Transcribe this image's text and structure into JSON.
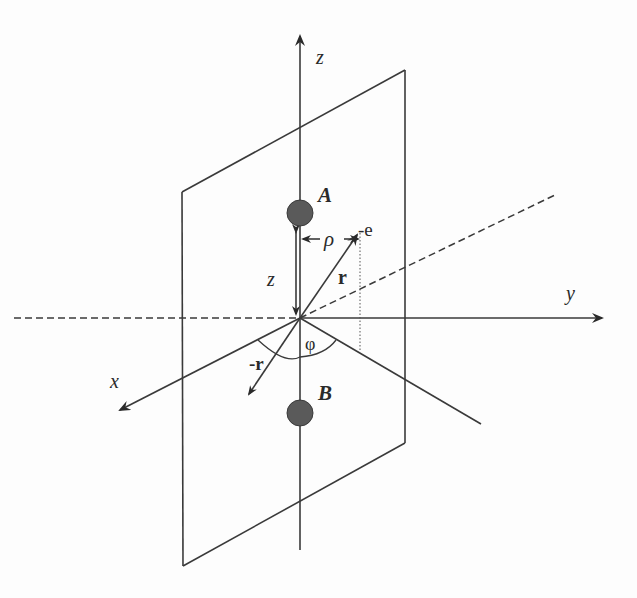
{
  "diagram": {
    "type": "3d-coordinate-geometry",
    "axes": {
      "x_label": "x",
      "y_label": "y",
      "z_label": "z"
    },
    "points": {
      "A_label": "A",
      "B_label": "B"
    },
    "vectors": {
      "r_label": "r",
      "neg_r_label": "-r",
      "electron_label": "-e",
      "rho_label": "ρ",
      "z_distance_label": "z",
      "angle_label": "φ"
    },
    "colors": {
      "line": "#3a3a3a",
      "nucleus_fill": "#5a5a5a",
      "background": "#fdfdfd"
    }
  }
}
